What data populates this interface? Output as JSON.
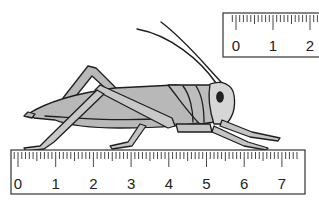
{
  "figure": {
    "colors": {
      "body_fill": "#b8b8b8",
      "head_fill": "#d4d4d4",
      "outline": "#1e1e1e",
      "ruler_fill": "#ffffff",
      "ruler_stroke": "#333333"
    }
  },
  "rulers": [
    {
      "id": "bottom-ruler",
      "unit": "cm",
      "labels": [
        "0",
        "1",
        "2",
        "3",
        "4",
        "5",
        "6",
        "7"
      ],
      "subdivisions_per_unit": 10
    },
    {
      "id": "top-ruler",
      "unit": "cm",
      "labels": [
        "0",
        "1",
        "2"
      ],
      "subdivisions_per_unit": 10
    }
  ]
}
